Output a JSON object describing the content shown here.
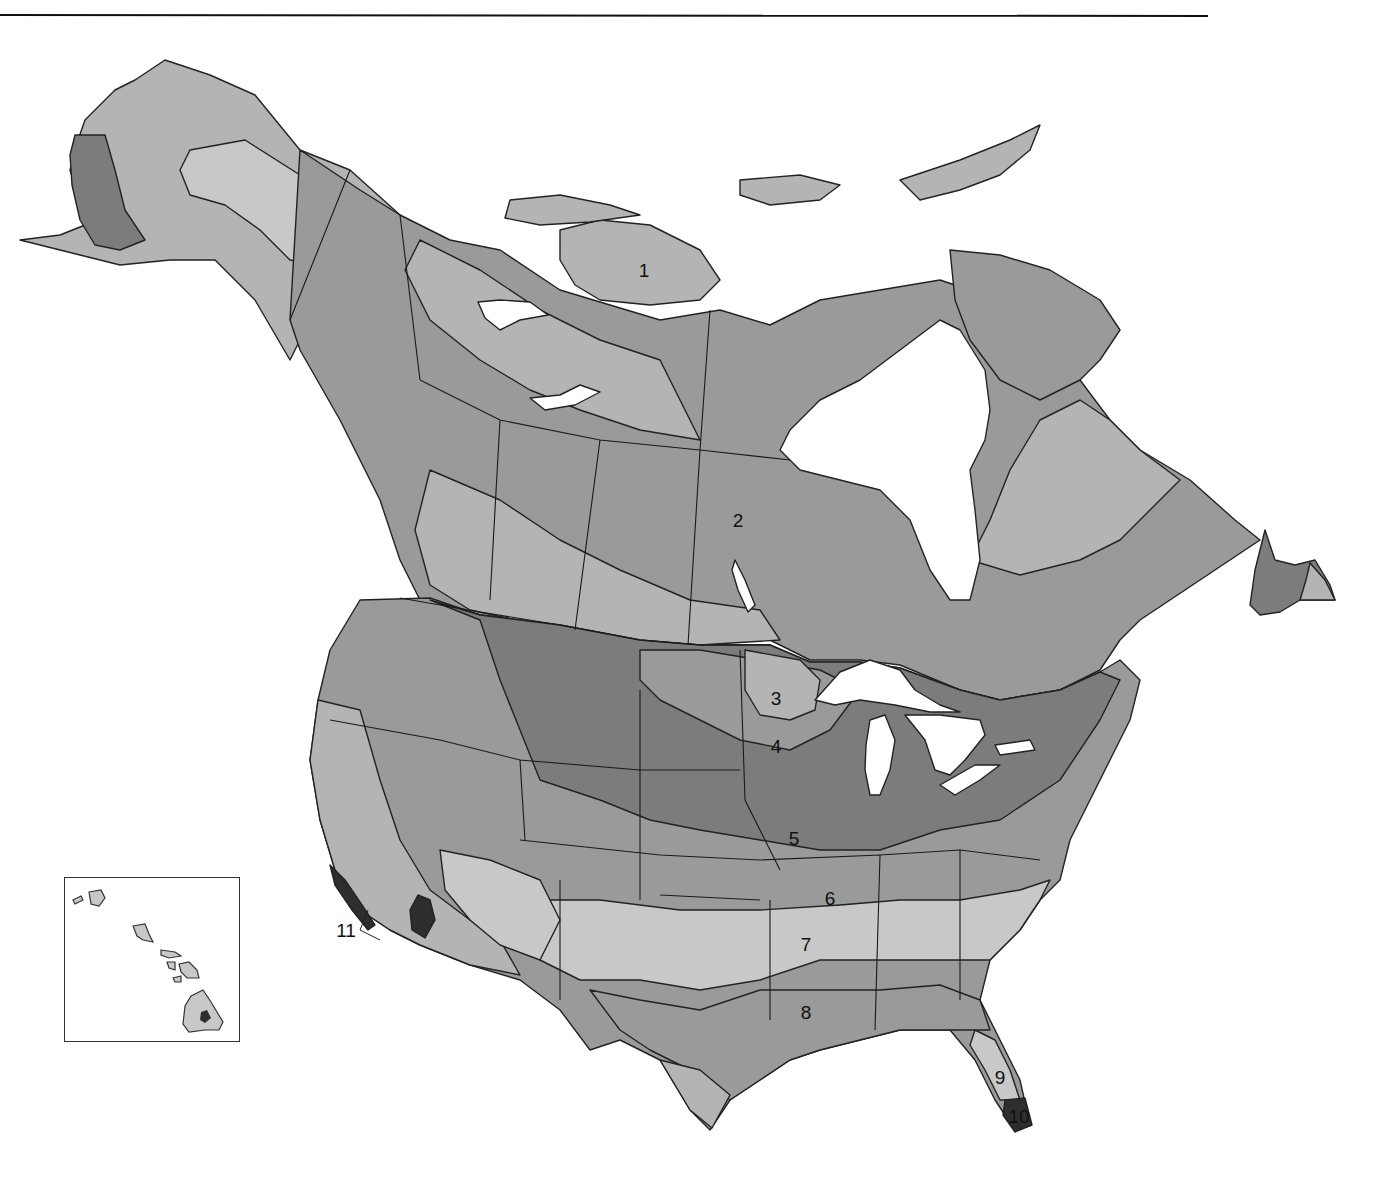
{
  "map": {
    "subject": "Plant hardiness zones of North America (United States and Canada)",
    "style": "grayscale",
    "colors": {
      "background": "#ffffff",
      "water": "#ffffff",
      "border_line": "#1a1a1a",
      "zone_light": "#c8c8c8",
      "zone_lightmid": "#b4b4b4",
      "zone_mid": "#9a9a9a",
      "zone_dark": "#7c7c7c",
      "zone_darkest": "#2e2e2e"
    },
    "zone_labels": [
      {
        "id": "1",
        "text": "1",
        "x": 644,
        "y": 270,
        "region": "Canadian Arctic"
      },
      {
        "id": "2",
        "text": "2",
        "x": 738,
        "y": 520,
        "region": "Central Canada"
      },
      {
        "id": "3",
        "text": "3",
        "x": 776,
        "y": 698,
        "region": "Minnesota"
      },
      {
        "id": "4",
        "text": "4",
        "x": 776,
        "y": 746,
        "region": "Southern Minnesota / Iowa"
      },
      {
        "id": "5",
        "text": "5",
        "x": 794,
        "y": 838,
        "region": "Missouri / Iowa"
      },
      {
        "id": "6",
        "text": "6",
        "x": 830,
        "y": 898,
        "region": "Missouri / Arkansas border"
      },
      {
        "id": "7",
        "text": "7",
        "x": 806,
        "y": 944,
        "region": "Arkansas / Oklahoma"
      },
      {
        "id": "8",
        "text": "8",
        "x": 806,
        "y": 1012,
        "region": "Louisiana"
      },
      {
        "id": "9",
        "text": "9",
        "x": 1000,
        "y": 1077,
        "region": "Central Florida"
      },
      {
        "id": "10",
        "text": "10",
        "x": 1019,
        "y": 1116,
        "region": "South Florida"
      },
      {
        "id": "11",
        "text": "11",
        "x": 346,
        "y": 930,
        "region": "Southern California coast"
      }
    ],
    "inset": {
      "name": "Hawaii",
      "x": 64,
      "y": 877,
      "width": 176,
      "height": 165
    }
  }
}
